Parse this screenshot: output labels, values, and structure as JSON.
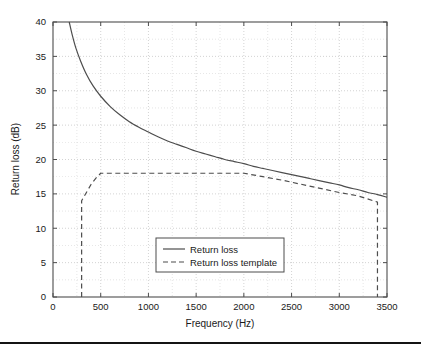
{
  "chart_data": {
    "type": "line",
    "title": "",
    "xlabel": "Frequency (Hz)",
    "ylabel": "Return loss (dB)",
    "xlim": [
      0,
      3500
    ],
    "ylim": [
      0,
      40
    ],
    "xticks": [
      0,
      500,
      1000,
      1500,
      2000,
      2500,
      3000,
      3500
    ],
    "yticks": [
      0,
      5,
      10,
      15,
      20,
      25,
      30,
      35,
      40
    ],
    "xtick_labels": [
      "0",
      "500",
      "1000",
      "1500",
      "2000",
      "2500",
      "3000",
      "3500"
    ],
    "ytick_labels": [
      "0",
      "5",
      "10",
      "15",
      "20",
      "25",
      "30",
      "35",
      "40"
    ],
    "grid": true,
    "grid_style": "dotted",
    "grid_color": "#c8c8c8",
    "minor_grid": true,
    "legend_position": "lower center",
    "series": [
      {
        "name": "Return loss",
        "style": "solid",
        "color": "#4d4d4d",
        "x": [
          170,
          200,
          240,
          290,
          350,
          420,
          500,
          600,
          700,
          800,
          900,
          1000,
          1100,
          1200,
          1300,
          1400,
          1500,
          1600,
          1700,
          1800,
          1900,
          2000,
          2100,
          2200,
          2300,
          2400,
          2500,
          2600,
          2700,
          2800,
          2900,
          3000,
          3100,
          3200,
          3300,
          3400,
          3500
        ],
        "y": [
          40.0,
          38.2,
          36.2,
          34.3,
          32.4,
          30.7,
          29.2,
          27.7,
          26.5,
          25.5,
          24.7,
          24.0,
          23.3,
          22.7,
          22.2,
          21.7,
          21.2,
          20.8,
          20.4,
          20.0,
          19.7,
          19.4,
          19.0,
          18.7,
          18.4,
          18.1,
          17.8,
          17.5,
          17.2,
          16.9,
          16.6,
          16.3,
          15.9,
          15.6,
          15.2,
          14.9,
          14.5
        ]
      },
      {
        "name": "Return loss template",
        "style": "dashed",
        "color": "#4d4d4d",
        "x": [
          300,
          300,
          350,
          400,
          450,
          500,
          800,
          1200,
          1600,
          2000,
          2200,
          2400,
          2600,
          2800,
          3000,
          3200,
          3400,
          3400
        ],
        "y": [
          0.0,
          14.0,
          15.2,
          16.4,
          17.3,
          18.0,
          18.0,
          18.0,
          18.0,
          18.0,
          17.5,
          17.0,
          16.4,
          15.8,
          15.2,
          14.7,
          13.8,
          0.0
        ]
      }
    ],
    "legend": [
      {
        "label": "Return loss",
        "style": "solid"
      },
      {
        "label": "Return loss template",
        "style": "dashed"
      }
    ]
  },
  "figure": {
    "background_color": "#ffffff",
    "axes_color": "#4d4d4d",
    "footer_rule_color": "#141414"
  }
}
